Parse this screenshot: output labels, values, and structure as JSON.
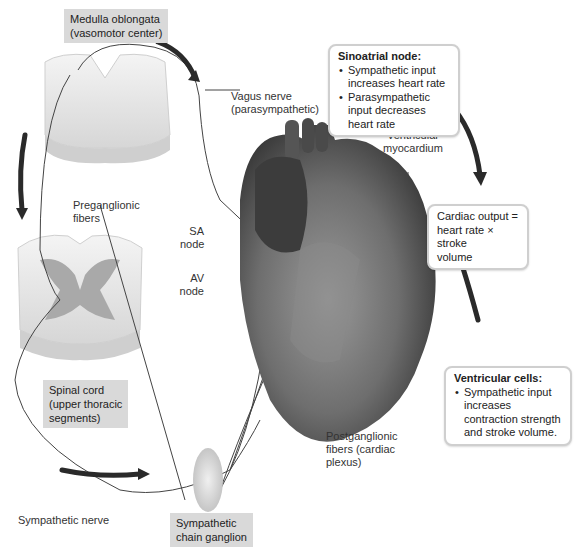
{
  "labels": {
    "medulla": [
      "Medulla oblongata",
      "(vasomotor center)"
    ],
    "vagus": [
      "Vagus nerve",
      "(parasympathetic)"
    ],
    "preganglionic": [
      "Preganglionic",
      "fibers"
    ],
    "sa_node": [
      "SA",
      "node"
    ],
    "av_node": [
      "AV",
      "node"
    ],
    "ventricular_myocardium": [
      "Ventricular",
      "myocardium"
    ],
    "spinal_cord": [
      "Spinal cord",
      "(upper thoracic",
      "segments)"
    ],
    "postganglionic": [
      "Postganglionic",
      "fibers (cardiac",
      "plexus)"
    ],
    "sympathetic_nerve": "Sympathetic nerve",
    "chain_ganglion": [
      "Sympathetic",
      "chain ganglion"
    ]
  },
  "callouts": {
    "sinoatrial": {
      "title": "Sinoatrial node:",
      "items": [
        "Sympathetic input increases heart rate",
        "Parasympathetic input decreases heart rate"
      ]
    },
    "cardiac_output": {
      "text": [
        "Cardiac output =",
        "heart rate × stroke",
        "volume"
      ]
    },
    "ventricular_cells": {
      "title": "Ventricular cells:",
      "items": [
        "Sympathetic input increases contraction strength and stroke volume."
      ]
    }
  }
}
